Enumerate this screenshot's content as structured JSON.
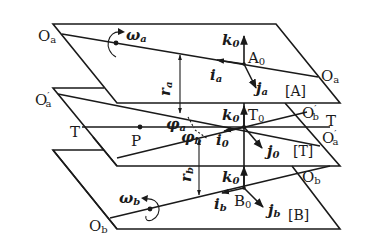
{
  "diagram": {
    "type": "coordinate-frame-diagram",
    "planes": [
      {
        "id": "A",
        "label": "[A]",
        "origin": "A0",
        "axis_label": "Oa",
        "axis_label_right": "Oa",
        "rotation": "ωa",
        "unit_vectors": [
          "k0",
          "ia",
          "ja"
        ]
      },
      {
        "id": "T",
        "label": "[T]",
        "origin": "T0",
        "axis_labels": [
          "O'a",
          "O'b",
          "T",
          "T",
          "O'a"
        ],
        "point": "P",
        "angles": [
          "φa",
          "φb"
        ],
        "unit_vectors": [
          "k0",
          "i0",
          "j0"
        ]
      },
      {
        "id": "B",
        "label": "[B]",
        "origin": "B0",
        "axis_label": "Ob",
        "axis_label_right": "Ob",
        "rotation": "ωb",
        "unit_vectors": [
          "k0",
          "ib",
          "jb"
        ]
      }
    ],
    "distances": [
      "ra",
      "rb"
    ]
  },
  "labels": {
    "Oa_left": {
      "main": "O",
      "sub": "a"
    },
    "Oa_right": {
      "main": "O",
      "sub": "a"
    },
    "omega_a": {
      "main": "ω",
      "sub": "a"
    },
    "k0_A": {
      "main": "k",
      "sub": "0"
    },
    "A0": {
      "main": "A",
      "sub": "0"
    },
    "ia": {
      "main": "i",
      "sub": "a"
    },
    "ja": {
      "main": "j",
      "sub": "a"
    },
    "A_bracket": "[A]",
    "r_a": {
      "main": "r",
      "sub": "a"
    },
    "Opa_left": {
      "main": "O",
      "prime": "′",
      "sub": "a"
    },
    "T_left": "T",
    "P": "P",
    "phi_a": {
      "main": "φ",
      "sub": "a"
    },
    "phi_b": {
      "main": "φ",
      "sub": "b"
    },
    "k0_T": {
      "main": "k",
      "sub": "0"
    },
    "T0": {
      "main": "T",
      "sub": "0"
    },
    "i0": {
      "main": "i",
      "sub": "0"
    },
    "j0": {
      "main": "j",
      "sub": "0"
    },
    "T_bracket": "[T]",
    "Opb_right": {
      "main": "O",
      "prime": "′",
      "sub": "b"
    },
    "T_right": "T",
    "Opa_right": {
      "main": "O",
      "prime": "′",
      "sub": "a"
    },
    "r_b": {
      "main": "r",
      "sub": "b"
    },
    "k0_B": {
      "main": "k",
      "sub": "0"
    },
    "B0": {
      "main": "B",
      "sub": "0"
    },
    "ib": {
      "main": "i",
      "sub": "b"
    },
    "jb": {
      "main": "j",
      "sub": "b"
    },
    "B_bracket": "[B]",
    "Ob_right": {
      "main": "O",
      "sub": "b"
    },
    "omega_b": {
      "main": "ω",
      "sub": "b"
    },
    "Ob_left": {
      "main": "O",
      "sub": "b"
    }
  },
  "colors": {
    "ink": "#1a1a1a",
    "background": "#ffffff"
  }
}
